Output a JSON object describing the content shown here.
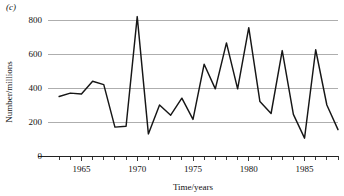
{
  "figure": {
    "panel_label": "(c)"
  },
  "chart_data": {
    "type": "line",
    "title": "",
    "subtitle": "",
    "xlabel": "Time/years",
    "ylabel": "Number/millions",
    "xlim": [
      1962,
      1988
    ],
    "ylim": [
      0,
      860
    ],
    "grid": true,
    "legend": "none",
    "y_ticks": [
      0,
      200,
      400,
      600,
      800
    ],
    "y_tick_labels": [
      "0",
      "200",
      "400",
      "600",
      "800"
    ],
    "x_ticks": [
      1963,
      1964,
      1965,
      1966,
      1967,
      1968,
      1969,
      1970,
      1971,
      1972,
      1973,
      1974,
      1975,
      1976,
      1977,
      1978,
      1979,
      1980,
      1981,
      1982,
      1983,
      1984,
      1985,
      1986,
      1987,
      1988
    ],
    "x_tick_labels": {
      "1965": "1965",
      "1970": "1970",
      "1975": "1975",
      "1980": "1980",
      "1985": "1985"
    },
    "series": [
      {
        "name": "series-1",
        "color": "#161616",
        "x": [
          1963,
          1964,
          1965,
          1966,
          1967,
          1968,
          1969,
          1970,
          1971,
          1972,
          1973,
          1974,
          1975,
          1976,
          1977,
          1978,
          1979,
          1980,
          1981,
          1982,
          1983,
          1984,
          1985,
          1986,
          1987,
          1988
        ],
        "values": [
          350,
          370,
          365,
          440,
          420,
          170,
          175,
          820,
          130,
          300,
          240,
          340,
          215,
          540,
          395,
          665,
          395,
          755,
          320,
          250,
          620,
          245,
          105,
          625,
          300,
          155
        ]
      }
    ]
  },
  "axes": {
    "y_axis_title": "Number/millions",
    "x_axis_title": "Time/years"
  }
}
